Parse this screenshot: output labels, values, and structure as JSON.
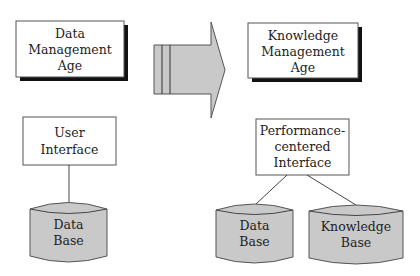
{
  "diagram": {
    "type": "transition-comparison",
    "left": {
      "era": {
        "lines": [
          "Data",
          "Management",
          "Age"
        ]
      },
      "interface": {
        "lines": [
          "User",
          "Interface"
        ]
      },
      "stores": [
        {
          "lines": [
            "Data",
            "Base"
          ]
        }
      ]
    },
    "transition_arrow": {
      "direction": "right",
      "icon": "block-arrow-right"
    },
    "right": {
      "era": {
        "lines": [
          "Knowledge",
          "Management",
          "Age"
        ]
      },
      "interface": {
        "lines": [
          "Performance-",
          "centered",
          "Interface"
        ]
      },
      "stores": [
        {
          "lines": [
            "Data",
            "Base"
          ]
        },
        {
          "lines": [
            "Knowledge",
            "Base"
          ]
        }
      ]
    },
    "colors": {
      "box_fill": "#ffffff",
      "shadow": "#111111",
      "cylinder_fill": "#c9c9c9",
      "arrow_fill": "#c9c9c9",
      "stroke": "#555555"
    }
  }
}
